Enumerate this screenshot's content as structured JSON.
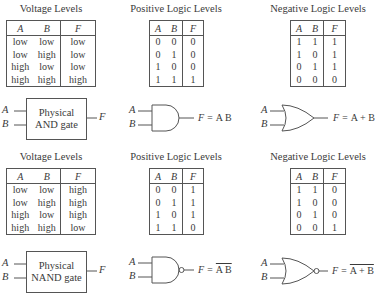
{
  "sections": [
    {
      "name": "and",
      "voltage": {
        "title": "Voltage Levels",
        "headers": [
          "A",
          "B",
          "F"
        ],
        "rows": [
          [
            "low",
            "low",
            "low"
          ],
          [
            "low",
            "high",
            "low"
          ],
          [
            "high",
            "low",
            "low"
          ],
          [
            "high",
            "high",
            "high"
          ]
        ]
      },
      "positive": {
        "title": "Positive Logic Levels",
        "headers": [
          "A",
          "B",
          "F"
        ],
        "rows": [
          [
            "0",
            "0",
            "0"
          ],
          [
            "0",
            "1",
            "0"
          ],
          [
            "1",
            "0",
            "0"
          ],
          [
            "1",
            "1",
            "1"
          ]
        ]
      },
      "negative": {
        "title": "Negative Logic Levels",
        "headers": [
          "A",
          "B",
          "F"
        ],
        "rows": [
          [
            "1",
            "1",
            "1"
          ],
          [
            "1",
            "0",
            "1"
          ],
          [
            "0",
            "1",
            "1"
          ],
          [
            "0",
            "0",
            "0"
          ]
        ]
      },
      "physical_gate": {
        "line1": "Physical",
        "line2": "AND gate",
        "in_a": "A",
        "in_b": "B",
        "out": "F"
      },
      "positive_gate": {
        "type": "AND",
        "in_a": "A",
        "in_b": "B",
        "equation_lhs": "F = ",
        "equation_rhs": "A B"
      },
      "negative_gate": {
        "type": "OR",
        "in_a": "A",
        "in_b": "B",
        "equation_lhs": "F = ",
        "equation_rhs": "A + B"
      }
    },
    {
      "name": "nand",
      "voltage": {
        "title": "Voltage Levels",
        "headers": [
          "A",
          "B",
          "F"
        ],
        "rows": [
          [
            "low",
            "low",
            "high"
          ],
          [
            "low",
            "high",
            "high"
          ],
          [
            "high",
            "low",
            "high"
          ],
          [
            "high",
            "high",
            "low"
          ]
        ]
      },
      "positive": {
        "title": "Positive Logic Levels",
        "headers": [
          "A",
          "B",
          "F"
        ],
        "rows": [
          [
            "0",
            "0",
            "1"
          ],
          [
            "0",
            "1",
            "1"
          ],
          [
            "1",
            "0",
            "1"
          ],
          [
            "1",
            "1",
            "0"
          ]
        ]
      },
      "negative": {
        "title": "Negative Logic Levels",
        "headers": [
          "A",
          "B",
          "F"
        ],
        "rows": [
          [
            "1",
            "1",
            "0"
          ],
          [
            "1",
            "0",
            "0"
          ],
          [
            "0",
            "1",
            "0"
          ],
          [
            "0",
            "0",
            "1"
          ]
        ]
      },
      "physical_gate": {
        "line1": "Physical",
        "line2": "NAND gate",
        "in_a": "A",
        "in_b": "B",
        "out": "F"
      },
      "positive_gate": {
        "type": "NAND",
        "in_a": "A",
        "in_b": "B",
        "equation_lhs": "F = ",
        "equation_rhs": "A B"
      },
      "negative_gate": {
        "type": "NOR",
        "in_a": "A",
        "in_b": "B",
        "equation_lhs": "F = ",
        "equation_rhs": "A + B"
      }
    }
  ]
}
